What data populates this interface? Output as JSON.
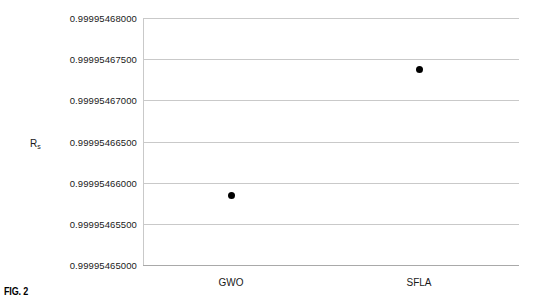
{
  "figure": {
    "caption": "FIG. 2"
  },
  "chart_data": {
    "type": "scatter",
    "title": "",
    "xlabel": "",
    "ylabel": "R_s",
    "ylabel_base": "R",
    "ylabel_sub": "s",
    "categories": [
      "GWO",
      "SFLA"
    ],
    "values": [
      0.9999546585,
      0.9999546737
    ],
    "points": [
      {
        "category": "GWO",
        "value": 0.9999546585
      },
      {
        "category": "SFLA",
        "value": 0.9999546737
      }
    ],
    "ylim": [
      0.99995465,
      0.99995468
    ],
    "yticks": [
      0.99995468,
      0.999954675,
      0.99995467,
      0.999954665,
      0.99995466,
      0.999954655,
      0.99995465
    ],
    "ytick_labels": [
      "0.99995468000",
      "0.99995467500",
      "0.99995467000",
      "0.99995466500",
      "0.99995466000",
      "0.99995465500",
      "0.99995465000"
    ],
    "xtick_labels": [
      "GWO",
      "SFLA"
    ],
    "grid": true,
    "legend": null,
    "marker": "filled-circle",
    "marker_color": "#000000",
    "grid_color": "#c9c9c9",
    "axis_color": "#a9a9a9",
    "background": "#ffffff"
  }
}
